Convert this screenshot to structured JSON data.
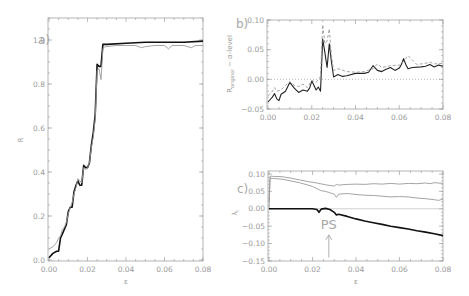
{
  "chart_data": [
    {
      "id": "a",
      "type": "line",
      "panel_label": "a)",
      "xlabel": "ε",
      "ylabel": "R",
      "xlim": [
        0.0,
        0.08
      ],
      "ylim": [
        0.0,
        1.1
      ],
      "xticks": [
        "0.00",
        "0.02",
        "0.04",
        "0.06",
        "0.08"
      ],
      "yticks": [
        "0.0",
        "0.2",
        "0.4",
        "0.6",
        "0.8",
        "1.0"
      ],
      "grid": false,
      "series": [
        {
          "name": "R (black)",
          "color": "#111111",
          "width": 1.6,
          "x": [
            0.0,
            0.002,
            0.004,
            0.005,
            0.006,
            0.007,
            0.008,
            0.009,
            0.01,
            0.011,
            0.012,
            0.013,
            0.014,
            0.015,
            0.016,
            0.017,
            0.018,
            0.019,
            0.02,
            0.021,
            0.022,
            0.023,
            0.024,
            0.025,
            0.026,
            0.027,
            0.028,
            0.029,
            0.03,
            0.04,
            0.05,
            0.06,
            0.07,
            0.08
          ],
          "y": [
            0.01,
            0.03,
            0.04,
            0.04,
            0.1,
            0.12,
            0.14,
            0.16,
            0.22,
            0.24,
            0.24,
            0.31,
            0.34,
            0.36,
            0.34,
            0.34,
            0.43,
            0.42,
            0.42,
            0.44,
            0.52,
            0.58,
            0.66,
            0.89,
            0.88,
            0.88,
            0.98,
            0.98,
            0.98,
            0.985,
            0.99,
            0.99,
            0.99,
            0.995
          ]
        },
        {
          "name": "R (gray)",
          "color": "#9a9a9a",
          "width": 0.9,
          "x": [
            0.0,
            0.002,
            0.004,
            0.005,
            0.006,
            0.007,
            0.008,
            0.009,
            0.01,
            0.011,
            0.012,
            0.013,
            0.014,
            0.015,
            0.016,
            0.017,
            0.018,
            0.019,
            0.02,
            0.021,
            0.022,
            0.023,
            0.024,
            0.025,
            0.026,
            0.027,
            0.028,
            0.029,
            0.03,
            0.035,
            0.04,
            0.045,
            0.048,
            0.05,
            0.055,
            0.06,
            0.062,
            0.064,
            0.07,
            0.074,
            0.076,
            0.08
          ],
          "y": [
            0.05,
            0.06,
            0.08,
            0.1,
            0.11,
            0.14,
            0.15,
            0.17,
            0.21,
            0.24,
            0.26,
            0.3,
            0.33,
            0.37,
            0.36,
            0.35,
            0.42,
            0.41,
            0.42,
            0.44,
            0.51,
            0.56,
            0.64,
            0.86,
            0.87,
            0.82,
            0.96,
            0.97,
            0.97,
            0.975,
            0.975,
            0.975,
            0.965,
            0.97,
            0.975,
            0.975,
            0.96,
            0.975,
            0.975,
            0.965,
            0.975,
            0.975
          ]
        }
      ]
    },
    {
      "id": "b",
      "type": "line",
      "panel_label": "b)",
      "xlabel": "",
      "ylabel": "R_original − α-level",
      "ylabel_main": "R",
      "ylabel_sub": "original",
      "ylabel_rest": " − α-level",
      "xlim": [
        0.0,
        0.08
      ],
      "ylim": [
        -0.05,
        0.1
      ],
      "xticks": [
        "0.00",
        "0.02",
        "0.04",
        "0.06",
        "0.08"
      ],
      "yticks": [
        "−0.05",
        "0.00",
        "0.05",
        "0.10"
      ],
      "reference_line": {
        "y": 0.0,
        "style": "dotted"
      },
      "grid": false,
      "series": [
        {
          "name": "difference (black)",
          "color": "#222222",
          "width": 1.1,
          "x": [
            0.0,
            0.001,
            0.002,
            0.003,
            0.004,
            0.005,
            0.006,
            0.008,
            0.01,
            0.011,
            0.012,
            0.014,
            0.016,
            0.018,
            0.019,
            0.02,
            0.021,
            0.022,
            0.023,
            0.024,
            0.025,
            0.026,
            0.027,
            0.028,
            0.029,
            0.03,
            0.032,
            0.034,
            0.036,
            0.04,
            0.044,
            0.046,
            0.048,
            0.05,
            0.052,
            0.054,
            0.056,
            0.058,
            0.06,
            0.061,
            0.062,
            0.063,
            0.064,
            0.066,
            0.07,
            0.072,
            0.074,
            0.076,
            0.078,
            0.08
          ],
          "y": [
            -0.038,
            -0.034,
            -0.03,
            -0.024,
            -0.033,
            -0.036,
            -0.025,
            -0.02,
            -0.005,
            -0.01,
            -0.015,
            -0.022,
            -0.018,
            -0.02,
            -0.015,
            -0.003,
            -0.01,
            -0.018,
            -0.013,
            -0.02,
            0.068,
            0.045,
            0.02,
            0.06,
            0.03,
            0.004,
            0.008,
            0.005,
            0.006,
            0.01,
            0.01,
            0.012,
            0.023,
            0.015,
            0.013,
            0.017,
            0.02,
            0.015,
            0.019,
            0.025,
            0.035,
            0.025,
            0.018,
            0.02,
            0.021,
            0.022,
            0.025,
            0.021,
            0.024,
            0.022
          ]
        },
        {
          "name": "difference (gray dashed)",
          "color": "#9a9a9a",
          "width": 0.9,
          "dash": "3,2",
          "x": [
            0.0,
            0.002,
            0.003,
            0.004,
            0.006,
            0.008,
            0.01,
            0.012,
            0.014,
            0.016,
            0.018,
            0.02,
            0.022,
            0.024,
            0.025,
            0.026,
            0.027,
            0.028,
            0.029,
            0.03,
            0.032,
            0.036,
            0.04,
            0.044,
            0.048,
            0.05,
            0.052,
            0.056,
            0.06,
            0.062,
            0.064,
            0.068,
            0.072,
            0.074,
            0.076,
            0.08
          ],
          "y": [
            -0.028,
            -0.02,
            -0.014,
            -0.02,
            -0.018,
            -0.01,
            -0.004,
            -0.01,
            -0.012,
            -0.008,
            -0.014,
            -0.002,
            -0.005,
            0.005,
            0.092,
            0.06,
            0.065,
            0.085,
            0.04,
            0.015,
            0.018,
            0.013,
            0.012,
            0.013,
            0.018,
            0.026,
            0.02,
            0.023,
            0.024,
            0.03,
            0.04,
            0.025,
            0.027,
            0.029,
            0.026,
            0.027
          ]
        }
      ]
    },
    {
      "id": "c",
      "type": "line",
      "panel_label": "c)",
      "xlabel": "ε",
      "ylabel": "λ_i",
      "ylabel_main": "λ",
      "ylabel_sub": "i",
      "xlim": [
        0.0,
        0.08
      ],
      "ylim": [
        -0.15,
        0.105
      ],
      "xticks": [
        "0.00",
        "0.02",
        "0.04",
        "0.06",
        "0.08"
      ],
      "yticks": [
        "−0.15",
        "−0.10",
        "−0.05",
        "0.00",
        "0.05",
        "0.10"
      ],
      "reference_line": {
        "y": 0.0,
        "style": "solid",
        "color": "#bbbbbb"
      },
      "annotations": [
        {
          "text": "PS",
          "x": 0.0275,
          "y": -0.045,
          "arrow_from_y": -0.14,
          "arrow_to_y": -0.075
        }
      ],
      "grid": false,
      "series": [
        {
          "name": "λ1 (gray upper)",
          "color": "#9a9a9a",
          "width": 0.9,
          "x": [
            0.0,
            0.0005,
            0.002,
            0.006,
            0.01,
            0.014,
            0.018,
            0.022,
            0.026,
            0.03,
            0.031,
            0.032,
            0.036,
            0.04,
            0.044,
            0.048,
            0.052,
            0.056,
            0.06,
            0.064,
            0.068,
            0.072,
            0.074,
            0.076,
            0.08
          ],
          "y": [
            0.02,
            0.094,
            0.093,
            0.092,
            0.088,
            0.083,
            0.078,
            0.074,
            0.069,
            0.065,
            0.07,
            0.068,
            0.07,
            0.071,
            0.07,
            0.072,
            0.071,
            0.073,
            0.071,
            0.073,
            0.072,
            0.074,
            0.072,
            0.075,
            0.073
          ]
        },
        {
          "name": "λ2 (gray lower)",
          "color": "#9a9a9a",
          "width": 0.9,
          "x": [
            0.0,
            0.0005,
            0.002,
            0.006,
            0.01,
            0.014,
            0.018,
            0.02,
            0.022,
            0.024,
            0.026,
            0.028,
            0.03,
            0.031,
            0.032,
            0.036,
            0.04,
            0.044,
            0.048,
            0.052,
            0.056,
            0.06,
            0.064,
            0.068,
            0.072,
            0.076,
            0.078,
            0.08
          ],
          "y": [
            0.0,
            0.088,
            0.087,
            0.085,
            0.08,
            0.075,
            0.068,
            0.064,
            0.058,
            0.052,
            0.05,
            0.046,
            0.042,
            0.033,
            0.042,
            0.044,
            0.041,
            0.039,
            0.038,
            0.036,
            0.034,
            0.035,
            0.034,
            0.031,
            0.029,
            0.026,
            0.024,
            0.028
          ]
        },
        {
          "name": "λ3 (black)",
          "color": "#111111",
          "width": 1.6,
          "x": [
            0.0,
            0.01,
            0.02,
            0.022,
            0.023,
            0.024,
            0.026,
            0.028,
            0.03,
            0.031,
            0.032,
            0.036,
            0.04,
            0.044,
            0.048,
            0.052,
            0.056,
            0.06,
            0.064,
            0.068,
            0.072,
            0.076,
            0.08
          ],
          "y": [
            0.0,
            0.0,
            0.0,
            -0.002,
            -0.01,
            -0.001,
            0.001,
            -0.002,
            -0.01,
            -0.018,
            -0.016,
            -0.022,
            -0.029,
            -0.035,
            -0.04,
            -0.045,
            -0.05,
            -0.054,
            -0.058,
            -0.063,
            -0.067,
            -0.072,
            -0.077
          ]
        }
      ]
    }
  ]
}
